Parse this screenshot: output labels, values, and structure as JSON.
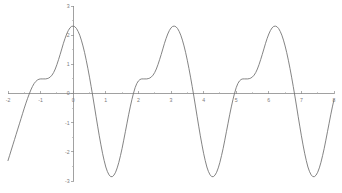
{
  "chart_data": {
    "type": "line",
    "title": "",
    "subtitle": "",
    "xlabel": "",
    "ylabel": "",
    "xlim": [
      -2,
      8
    ],
    "ylim": [
      -3,
      3
    ],
    "grid": false,
    "legend": false,
    "legend_position": "none",
    "x_ticks": [
      -2,
      -1,
      0,
      1,
      2,
      3,
      4,
      5,
      6,
      7,
      8
    ],
    "x_tick_labels": [
      "-2",
      "-1",
      "0",
      "1",
      "2",
      "3",
      "4",
      "5",
      "6",
      "7",
      "8"
    ],
    "x_minor_ticks": [
      -1.5,
      -0.5,
      0.5,
      1.5,
      2.5,
      3.5,
      4.5,
      5.5,
      6.5,
      7.5
    ],
    "y_ticks": [
      -3,
      -2,
      -1,
      0,
      1,
      2,
      3
    ],
    "y_tick_labels": [
      "-3",
      "-2",
      "-1",
      "0",
      "1",
      "2",
      "3"
    ],
    "y_minor_ticks": [
      -2.5,
      -1.5,
      -0.5,
      0.5,
      1.5,
      2.5
    ],
    "axis_color": "#8a8a8a",
    "curve_color": "#6e6e6e",
    "background_color": "#ffffff",
    "period": 3.2,
    "peak_value": 2.3,
    "trough_value": -2.8,
    "plateau_value": 0.5,
    "series": [
      {
        "name": "f(x)",
        "x": [
          -2.0,
          -1.95,
          -1.9,
          -1.85,
          -1.8,
          -1.75,
          -1.7,
          -1.65,
          -1.6,
          -1.55,
          -1.5,
          -1.45,
          -1.4,
          -1.35,
          -1.3,
          -1.25,
          -1.2,
          -1.15,
          -1.1,
          -1.05,
          -1.0,
          -0.95,
          -0.9,
          -0.85,
          -0.8,
          -0.75,
          -0.7,
          -0.65,
          -0.6,
          -0.55,
          -0.5,
          -0.45,
          -0.4,
          -0.35,
          -0.3,
          -0.25,
          -0.2,
          -0.15,
          -0.1,
          -0.05,
          0.0,
          0.05,
          0.1,
          0.15,
          0.2,
          0.25,
          0.3,
          0.35,
          0.4,
          0.45,
          0.5,
          0.55,
          0.6,
          0.65,
          0.7,
          0.75,
          0.8,
          0.85,
          0.9,
          0.95,
          1.0,
          1.05,
          1.1,
          1.15,
          1.2,
          1.25,
          1.3,
          1.35,
          1.4,
          1.45,
          1.5,
          1.55,
          1.6,
          1.65,
          1.7,
          1.75,
          1.8,
          1.85,
          1.9,
          1.95,
          2.0,
          2.05,
          2.1,
          2.15,
          2.2,
          2.25,
          2.3,
          2.35,
          2.4,
          2.45,
          2.5,
          2.55,
          2.6,
          2.65,
          2.7,
          2.75,
          2.8,
          2.85,
          2.9,
          2.95,
          3.0,
          3.05,
          3.1,
          3.15,
          3.2,
          3.25,
          3.3,
          3.35,
          3.4,
          3.45,
          3.5,
          3.55,
          3.6,
          3.65,
          3.7,
          3.75,
          3.8,
          3.85,
          3.9,
          3.95,
          4.0,
          4.05,
          4.1,
          4.15,
          4.2,
          4.25,
          4.3,
          4.35,
          4.4,
          4.45,
          4.5,
          4.55,
          4.6,
          4.65,
          4.7,
          4.75,
          4.8,
          4.85,
          4.9,
          4.95,
          5.0,
          5.05,
          5.1,
          5.15,
          5.2,
          5.25,
          5.3,
          5.35,
          5.4,
          5.45,
          5.5,
          5.55,
          5.6,
          5.65,
          5.7,
          5.75,
          5.8,
          5.85,
          5.9,
          5.95,
          6.0,
          6.05,
          6.1,
          6.15,
          6.2,
          6.25,
          6.3,
          6.35,
          6.4,
          6.45,
          6.5,
          6.55,
          6.6,
          6.65,
          6.7,
          6.75,
          6.8,
          6.85,
          6.9,
          6.95,
          7.0,
          7.05,
          7.1,
          7.15,
          7.2,
          7.25,
          7.3,
          7.35,
          7.4,
          7.45,
          7.5,
          7.55,
          7.6,
          7.65,
          7.7,
          7.75,
          7.8,
          7.85,
          7.9,
          7.95,
          8.0
        ],
        "y": [
          -2.3,
          -2.12,
          -1.94,
          -1.76,
          -1.58,
          -1.4,
          -1.22,
          -1.04,
          -0.86,
          -0.68,
          -0.5,
          -0.33,
          -0.17,
          -0.02,
          0.12,
          0.24,
          0.34,
          0.41,
          0.46,
          0.49,
          0.5,
          0.5,
          0.5,
          0.5,
          0.51,
          0.53,
          0.57,
          0.63,
          0.72,
          0.84,
          0.99,
          1.16,
          1.34,
          1.53,
          1.72,
          1.89,
          2.04,
          2.16,
          2.25,
          2.3,
          2.31,
          2.29,
          2.23,
          2.13,
          2.0,
          1.83,
          1.63,
          1.4,
          1.14,
          0.86,
          0.56,
          0.24,
          -0.09,
          -0.43,
          -0.78,
          -1.12,
          -1.45,
          -1.76,
          -2.05,
          -2.3,
          -2.52,
          -2.68,
          -2.79,
          -2.85,
          -2.85,
          -2.8,
          -2.7,
          -2.55,
          -2.36,
          -2.13,
          -1.88,
          -1.6,
          -1.31,
          -1.02,
          -0.73,
          -0.46,
          -0.21,
          0.01,
          0.2,
          0.34,
          0.43,
          0.48,
          0.5,
          0.5,
          0.5,
          0.5,
          0.51,
          0.53,
          0.57,
          0.63,
          0.72,
          0.84,
          0.99,
          1.16,
          1.34,
          1.53,
          1.72,
          1.89,
          2.04,
          2.16,
          2.25,
          2.3,
          2.31,
          2.29,
          2.23,
          2.13,
          2.0,
          1.83,
          1.63,
          1.4,
          1.14,
          0.86,
          0.56,
          0.24,
          -0.09,
          -0.43,
          -0.78,
          -1.12,
          -1.45,
          -1.76,
          -2.05,
          -2.3,
          -2.52,
          -2.68,
          -2.79,
          -2.85,
          -2.85,
          -2.8,
          -2.7,
          -2.55,
          -2.36,
          -2.13,
          -1.88,
          -1.6,
          -1.31,
          -1.02,
          -0.73,
          -0.46,
          -0.21,
          0.01,
          0.2,
          0.34,
          0.43,
          0.48,
          0.5,
          0.5,
          0.5,
          0.5,
          0.51,
          0.53,
          0.57,
          0.63,
          0.72,
          0.84,
          0.99,
          1.16,
          1.34,
          1.53,
          1.72,
          1.89,
          2.04,
          2.16,
          2.25,
          2.3,
          2.31,
          2.29,
          2.23,
          2.13,
          2.0,
          1.83,
          1.63,
          1.4,
          1.14,
          0.86,
          0.56,
          0.24,
          -0.09,
          -0.43,
          -0.78,
          -1.12,
          -1.45,
          -1.76,
          -2.05,
          -2.3,
          -2.52,
          -2.68,
          -2.79,
          -2.85,
          -2.85,
          -2.8,
          -2.7,
          -2.55,
          -2.36,
          -2.13,
          -1.88,
          -1.6,
          -1.31,
          -1.02,
          -0.73,
          -0.46,
          -0.21
        ]
      }
    ]
  }
}
